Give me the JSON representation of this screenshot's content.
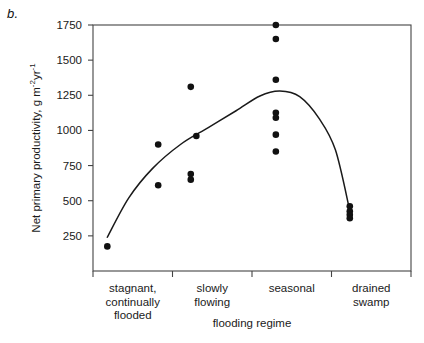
{
  "panel_label": "b.",
  "chart_data": {
    "type": "scatter",
    "title": "",
    "xlabel": "flooding regime",
    "ylabel_html": "Net primary productivity, g m<sup>-2</sup>yr<sup>-1</sup>",
    "ylabel": "Net primary productivity, g m-2yr-1",
    "categories": [
      "stagnant, continually flooded",
      "slowly flowing",
      "seasonal",
      "drained swamp"
    ],
    "category_label_lines": [
      [
        "stagnant,",
        "continually",
        "flooded"
      ],
      [
        "slowly",
        "flowing"
      ],
      [
        "seasonal"
      ],
      [
        "drained",
        "swamp"
      ]
    ],
    "ylim": [
      0,
      1750
    ],
    "yticks": [
      250,
      500,
      750,
      1000,
      1250,
      1500,
      1750
    ],
    "ytick_labels": [
      "250",
      "500",
      "750",
      "1000",
      "1250",
      "1500",
      "1750"
    ],
    "grid": false,
    "legend": "none",
    "marker_color": "#111111",
    "curve_color": "#1a1a1a",
    "axis_color": "#444444",
    "series": [
      {
        "name": "net primary productivity observations",
        "points": [
          {
            "category": "stagnant, continually flooded",
            "x": 1.82,
            "y": 900
          },
          {
            "category": "stagnant, continually flooded",
            "x": 1.82,
            "y": 610
          },
          {
            "category": "stagnant, continually flooded",
            "x": 1.18,
            "y": 175
          },
          {
            "category": "slowly flowing",
            "x": 2.23,
            "y": 1310
          },
          {
            "category": "slowly flowing",
            "x": 2.3,
            "y": 960
          },
          {
            "category": "slowly flowing",
            "x": 2.23,
            "y": 690
          },
          {
            "category": "slowly flowing",
            "x": 2.23,
            "y": 650
          },
          {
            "category": "seasonal",
            "x": 3.3,
            "y": 1750
          },
          {
            "category": "seasonal",
            "x": 3.3,
            "y": 1650
          },
          {
            "category": "seasonal",
            "x": 3.3,
            "y": 1360
          },
          {
            "category": "seasonal",
            "x": 3.3,
            "y": 1125
          },
          {
            "category": "seasonal",
            "x": 3.3,
            "y": 1090
          },
          {
            "category": "seasonal",
            "x": 3.3,
            "y": 970
          },
          {
            "category": "seasonal",
            "x": 3.3,
            "y": 850
          },
          {
            "category": "drained swamp",
            "x": 4.23,
            "y": 460
          },
          {
            "category": "drained swamp",
            "x": 4.23,
            "y": 425
          },
          {
            "category": "drained swamp",
            "x": 4.23,
            "y": 400
          },
          {
            "category": "drained swamp",
            "x": 4.23,
            "y": 375
          }
        ]
      }
    ],
    "fit_curve": {
      "name": "fitted trend",
      "description": "hump-shaped curve peaking in the seasonal flooding regime",
      "points": [
        {
          "x": 1.18,
          "y": 240
        },
        {
          "x": 1.45,
          "y": 520
        },
        {
          "x": 1.75,
          "y": 730
        },
        {
          "x": 2.1,
          "y": 900
        },
        {
          "x": 2.45,
          "y": 1020
        },
        {
          "x": 2.8,
          "y": 1140
        },
        {
          "x": 3.1,
          "y": 1245
        },
        {
          "x": 3.35,
          "y": 1280
        },
        {
          "x": 3.6,
          "y": 1240
        },
        {
          "x": 3.85,
          "y": 1080
        },
        {
          "x": 4.05,
          "y": 860
        },
        {
          "x": 4.23,
          "y": 430
        }
      ]
    }
  }
}
